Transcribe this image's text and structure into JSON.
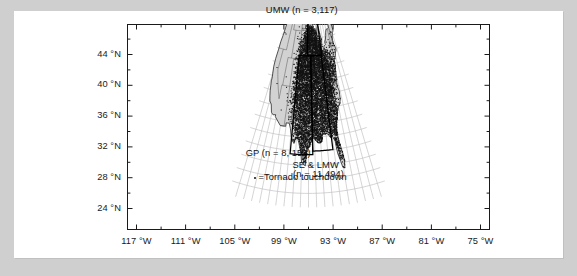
{
  "figure": {
    "projection": "conic",
    "legend": {
      "marker": "dot",
      "text": "=Tornado touchdown"
    },
    "regions": [
      {
        "id": "umw",
        "label": "UMW (n = 3,117)",
        "name": "Upper Midwest"
      },
      {
        "id": "gp",
        "label": "GP (n = 8, 152)",
        "name": "Great Plains"
      },
      {
        "id": "se_lmw1",
        "label": "SE & LMW",
        "name": "Southeast & Lower Midwest"
      },
      {
        "id": "se_lmw2",
        "label": "(n = 11,494)",
        "name": "Southeast & Lower Midwest count"
      }
    ]
  },
  "chart_data": {
    "type": "scatter",
    "title": "",
    "xlabel": "",
    "ylabel": "",
    "grid": true,
    "legend_position": "inside-bottom-left",
    "x_tick_labels": [
      "117 °W",
      "111 °W",
      "105 °W",
      "99 °W",
      "93 °W",
      "87 °W",
      "81 °W",
      "75 °W"
    ],
    "x_tick_values": [
      -117,
      -111,
      -105,
      -99,
      -93,
      -87,
      -81,
      -75
    ],
    "y_tick_labels": [
      "44 °N",
      "40 °N",
      "36 °N",
      "32 °N",
      "28 °N",
      "24 °N"
    ],
    "y_tick_values": [
      44,
      40,
      36,
      32,
      28,
      24
    ],
    "xlim": [
      -120,
      -72
    ],
    "ylim": [
      22,
      50
    ],
    "minor_tick_interval_x": 3,
    "minor_tick_interval_y": 2,
    "series": [
      {
        "name": "Tornado touchdown",
        "marker": "dot",
        "color": "#111111",
        "region_counts": [
          {
            "region": "UMW",
            "n": 3117
          },
          {
            "region": "GP",
            "n": 8152
          },
          {
            "region": "SE & LMW",
            "n": 11494
          }
        ],
        "total_n": 22763
      }
    ],
    "annotations": [
      {
        "text": "UMW (n = 3,117)",
        "x": -90.5,
        "y": 47.6
      },
      {
        "text": "GP (n = 8, 152)",
        "x": -112.0,
        "y": 26.9
      },
      {
        "text": "SE & LMW",
        "x": -91.5,
        "y": 25.6
      },
      {
        "text": "(n = 11,494)",
        "x": -91.5,
        "y": 24.2
      },
      {
        "text": "=Tornado touchdown",
        "x": -117.0,
        "y": 23.3
      }
    ]
  }
}
